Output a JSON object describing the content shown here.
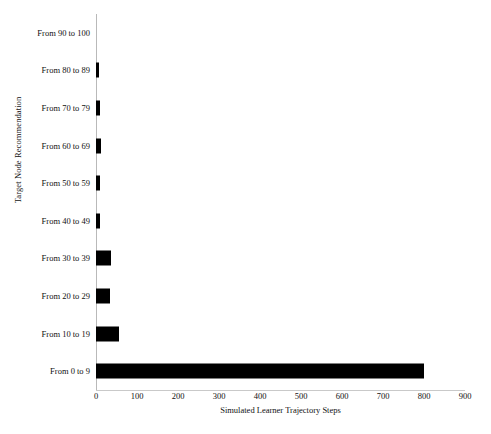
{
  "chart_data": {
    "type": "bar",
    "orientation": "horizontal",
    "title": "",
    "xlabel": "Simulated Learner Trajectory Steps",
    "ylabel": "Target Node Recommendation",
    "categories": [
      "From 90 to 100",
      "From 80 to 89",
      "From 70 to 79",
      "From 60 to 69",
      "From 50 to 59",
      "From 40 to 49",
      "From 30 to 39",
      "From 20 to 29",
      "From 10 to 19",
      "From 0 to 9"
    ],
    "values": [
      0,
      8,
      9,
      11,
      10,
      9,
      36,
      34,
      57,
      800
    ],
    "xlim": [
      0,
      900
    ],
    "xticks": [
      0,
      100,
      200,
      300,
      400,
      500,
      600,
      700,
      800,
      900
    ],
    "xtick_labels": [
      "0",
      "100",
      "200",
      "300",
      "400",
      "500",
      "600",
      "700",
      "800",
      "900"
    ],
    "grid": false,
    "legend": null,
    "bar_color": "#000000",
    "axis_color": "#b9b9b9",
    "background": "#ffffff"
  }
}
